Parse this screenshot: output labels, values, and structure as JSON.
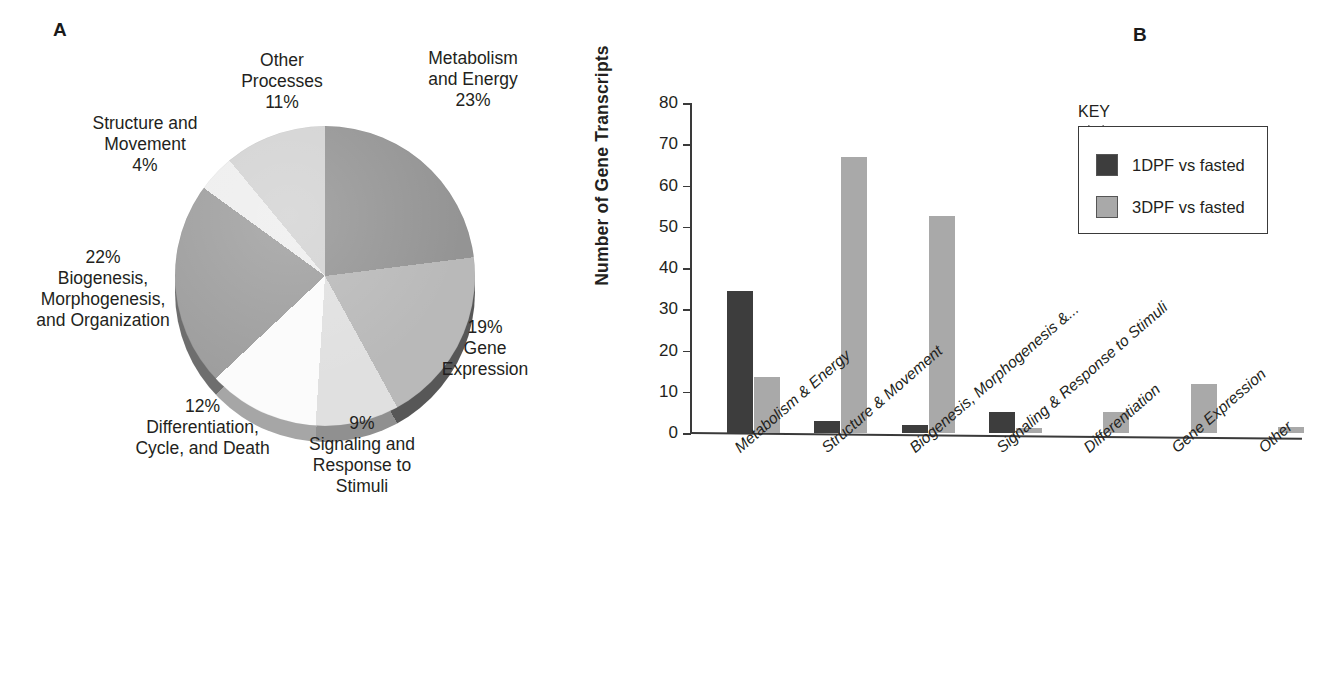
{
  "panels": {
    "a": {
      "letter": "A"
    },
    "b": {
      "letter": "B"
    }
  },
  "chart_data": [
    {
      "type": "pie",
      "title": "",
      "panel": "A",
      "unit": "%",
      "legend_position": "labels-around-pie",
      "categories": [
        "Metabolism and Energy",
        "Gene Expression",
        "Signaling and Response to Stimuli",
        "Differentiation, Cycle, and Death",
        "Biogenesis, Morphogenesis, and Organization",
        "Structure and Movement",
        "Other Processes"
      ],
      "values": [
        23,
        19,
        9,
        12,
        22,
        4,
        11
      ],
      "slice_colors": [
        "#949494",
        "#b9b9b9",
        "#e0e0e0",
        "#fbfbfb",
        "#9e9e9e",
        "#eeeeee",
        "#d3d3d3"
      ],
      "labels": [
        {
          "name": "Metabolism\nand Energy",
          "percent": "23%"
        },
        {
          "name": "Gene\nExpression",
          "percent": "19%"
        },
        {
          "name": "Signaling and\nResponse to\nStimuli",
          "percent": "9%"
        },
        {
          "name": "Differentiation,\nCycle, and Death",
          "percent": "12%"
        },
        {
          "name": "Biogenesis,\nMorphogenesis,\nand Organization",
          "percent": "22%"
        },
        {
          "name": "Structure and\nMovement",
          "percent": "4%"
        },
        {
          "name": "Other\nProcesses",
          "percent": "11%"
        }
      ],
      "label_text": {
        "metabolism": "Metabolism\nand Energy\n23%",
        "gene_expression": "19%\nGene\nExpression",
        "signaling": "9%\nSignaling and\nResponse to\nStimuli",
        "differentiation": "12%\nDifferentiation,\nCycle, and Death",
        "biogenesis": "22%\nBiogenesis,\nMorphogenesis,\nand Organization",
        "structure": "Structure and\nMovement\n4%",
        "other": "Other\nProcesses\n11%"
      }
    },
    {
      "type": "bar",
      "panel": "B",
      "title": "",
      "xlabel": "",
      "ylabel": "Number of Gene Transcripts",
      "ylim": [
        0,
        80
      ],
      "yticks": [
        0,
        10,
        20,
        30,
        40,
        50,
        60,
        70,
        80
      ],
      "grid": false,
      "legend_position": "top-right",
      "legend_title": "KEY",
      "categories": [
        "Metabolism & Energy",
        "Structure & Movement",
        "Biogenesis, Morphogenesis &...",
        "Signaling & Response to Stimuli",
        "Differentiation",
        "Gene Expression",
        "Other"
      ],
      "series": [
        {
          "name": "1DPF vs fasted",
          "color": "#3d3d3d",
          "values": [
            34.5,
            3,
            2,
            5,
            0,
            0,
            0
          ]
        },
        {
          "name": "3DPF vs fasted",
          "color": "#a9a9a9",
          "values": [
            13.5,
            67,
            52.5,
            1.2,
            5,
            12,
            1.5
          ]
        }
      ]
    }
  ],
  "panel_b": {
    "yaxis_title": "Number of Gene Transcripts",
    "ytick_labels": [
      "80",
      "70",
      "60",
      "50",
      "40",
      "30",
      "20",
      "10",
      "0"
    ],
    "xtick_labels": [
      "Metabolism & Energy",
      "Structure & Movement",
      "Biogenesis, Morphogenesis &...",
      "Signaling & Response to Stimuli",
      "Differentiation",
      "Gene Expression",
      "Other"
    ],
    "key": {
      "title": "KEY",
      "items": [
        {
          "label": "1DPF vs fasted",
          "color": "#3d3d3d"
        },
        {
          "label": "3DPF vs fasted",
          "color": "#a9a9a9"
        }
      ]
    }
  }
}
